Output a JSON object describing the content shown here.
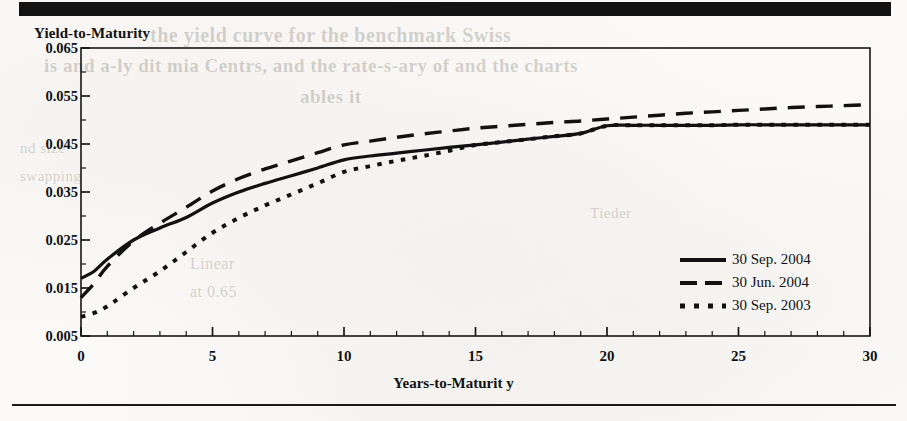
{
  "page": {
    "top_band": "black-header-bar",
    "bottom_rule": "horizontal-rule",
    "ghost_text": {
      "l1": "the yield curve for the benchmark Swiss",
      "l2": "is and a-ly dit mia Centrs, and the rate-s-ary of and the charts",
      "l3": "ables it",
      "l4": "nd size",
      "l5": "swapping",
      "l6": "Linear",
      "l7": "at 0.65",
      "l8": "Tieder"
    }
  },
  "chart_data": {
    "type": "line",
    "title": "",
    "ylabel": "Yield-to-Maturity",
    "xlabel": "Years-to-Maturit y",
    "xlim": [
      0,
      30
    ],
    "ylim": [
      0.005,
      0.065
    ],
    "xticks": [
      0,
      5,
      10,
      15,
      20,
      25,
      30
    ],
    "xtick_labels": [
      "0",
      "5",
      "10",
      "15",
      "20",
      "25",
      "30"
    ],
    "xminor_step": 1,
    "yticks": [
      0.005,
      0.015,
      0.025,
      0.035,
      0.045,
      0.055,
      0.065
    ],
    "ytick_labels": [
      "0.005",
      "0.015",
      "0.025",
      "0.035",
      "0.045",
      "0.055",
      "0.065"
    ],
    "yminor_step": 0.005,
    "grid": false,
    "legend_position": "lower-right",
    "x": [
      0,
      0.5,
      1,
      2,
      3,
      4,
      5,
      6,
      7,
      8,
      9,
      10,
      11,
      12,
      13,
      14,
      15,
      16,
      17,
      18,
      19,
      20,
      21,
      22,
      23,
      24,
      25,
      26,
      27,
      28,
      29,
      30
    ],
    "series": [
      {
        "name": "30 Sep. 2004",
        "style": "solid",
        "color": "#111111",
        "values": [
          0.017,
          0.0185,
          0.021,
          0.025,
          0.0275,
          0.0297,
          0.0327,
          0.035,
          0.0368,
          0.0384,
          0.04,
          0.0417,
          0.0425,
          0.0431,
          0.0437,
          0.0443,
          0.0448,
          0.0454,
          0.046,
          0.0466,
          0.0472,
          0.0488,
          0.0489,
          0.0489,
          0.0489,
          0.0489,
          0.049,
          0.049,
          0.049,
          0.049,
          0.049,
          0.049
        ]
      },
      {
        "name": "30 Jun. 2004",
        "style": "dashed",
        "color": "#111111",
        "values": [
          0.013,
          0.016,
          0.0195,
          0.0248,
          0.0285,
          0.0318,
          0.0352,
          0.0378,
          0.0398,
          0.0415,
          0.0432,
          0.0448,
          0.0456,
          0.0464,
          0.0471,
          0.0477,
          0.0483,
          0.0487,
          0.0491,
          0.0495,
          0.0498,
          0.0502,
          0.0506,
          0.051,
          0.0514,
          0.0517,
          0.052,
          0.0523,
          0.0526,
          0.0528,
          0.053,
          0.0532
        ]
      },
      {
        "name": "30 Sep. 2003",
        "style": "dotted",
        "color": "#111111",
        "values": [
          0.009,
          0.0098,
          0.0112,
          0.015,
          0.0185,
          0.0225,
          0.0265,
          0.0296,
          0.0322,
          0.0345,
          0.0368,
          0.0392,
          0.0404,
          0.0415,
          0.0425,
          0.0436,
          0.0448,
          0.0454,
          0.046,
          0.0466,
          0.0472,
          0.0488,
          0.0489,
          0.0489,
          0.0489,
          0.0489,
          0.049,
          0.049,
          0.049,
          0.049,
          0.049,
          0.049
        ]
      }
    ]
  }
}
